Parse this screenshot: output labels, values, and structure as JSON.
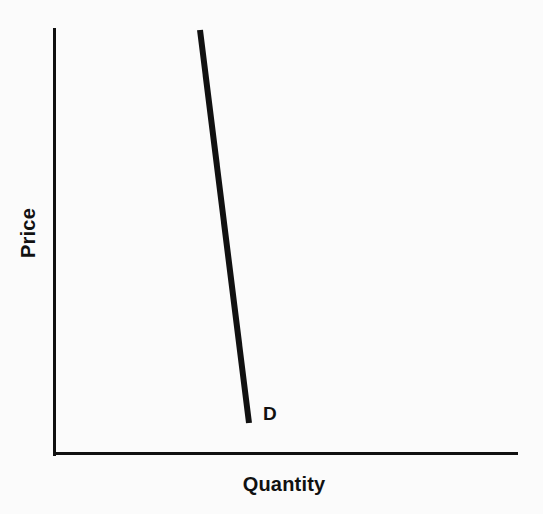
{
  "figure": {
    "background_color": "#fbfbfb",
    "ink_color": "#111111"
  },
  "labels": {
    "y_axis": "Price",
    "x_axis": "Quantity",
    "curve": "D"
  },
  "chart_data": {
    "type": "line",
    "title": "",
    "subtitle": "",
    "xlabel": "Quantity",
    "ylabel": "Price",
    "xlim": [
      0,
      10
    ],
    "ylim": [
      0,
      10
    ],
    "grid": false,
    "legend": "none",
    "axis_ticks": {
      "x": [],
      "y": []
    },
    "annotations": [
      {
        "text": "D",
        "x": 4.7,
        "y": 0.75,
        "note": "demand curve end label"
      }
    ],
    "series": [
      {
        "name": "D",
        "description": "Steep (relatively inelastic) downward-sloping demand curve",
        "x": [
          3.16,
          4.21
        ],
        "y": [
          9.95,
          0.75
        ],
        "line_width_px": 6,
        "color": "#111111"
      }
    ]
  },
  "geometry": {
    "y_axis": {
      "x": 53,
      "y_top": 28,
      "y_bottom": 456,
      "width_px": 3
    },
    "x_axis": {
      "y": 455,
      "x_left": 53,
      "x_right": 518,
      "width_px": 3
    },
    "curve": {
      "x1": 200,
      "y1": 30,
      "x2": 249,
      "y2": 423,
      "width_px": 6
    }
  }
}
